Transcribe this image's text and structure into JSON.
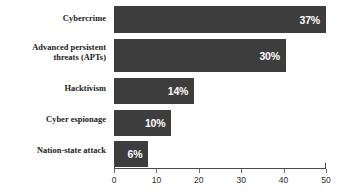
{
  "chart_data": {
    "type": "bar",
    "orientation": "horizontal",
    "title": "",
    "xlabel": "",
    "ylabel": "",
    "categories": [
      "Cybercrime",
      "Advanced persistent\nthreats (APTs)",
      "Hacktivism",
      "Cyber espionage",
      "Nation-state attack"
    ],
    "values": [
      37,
      30,
      14,
      10,
      6
    ],
    "value_labels": [
      "37%",
      "30%",
      "14%",
      "10%",
      "6%"
    ],
    "xlim": [
      0,
      50
    ],
    "xticks": [
      0,
      10,
      20,
      30,
      40,
      50
    ],
    "xtick_labels": [
      "0",
      "10",
      "20",
      "30",
      "40",
      "50"
    ],
    "grid": false,
    "legend": false,
    "bar_color": "#3d3d3d",
    "value_label_color": "#ffffff",
    "axis_color": "#4a4a4a",
    "background_color": "#ffffff"
  },
  "categories": [
    {
      "label_line1": "Cybercrime",
      "label_line2": "",
      "value_label": "37%",
      "value": 37
    },
    {
      "label_line1": "Advanced persistent",
      "label_line2": "threats (APTs)",
      "value_label": "30%",
      "value": 30
    },
    {
      "label_line1": "Hacktivism",
      "label_line2": "",
      "value_label": "14%",
      "value": 14
    },
    {
      "label_line1": "Cyber espionage",
      "label_line2": "",
      "value_label": "10%",
      "value": 10
    },
    {
      "label_line1": "Nation-state attack",
      "label_line2": "",
      "value_label": "6%",
      "value": 6
    }
  ],
  "axis": {
    "ticks": [
      "0",
      "10",
      "20",
      "30",
      "40",
      "50"
    ]
  }
}
